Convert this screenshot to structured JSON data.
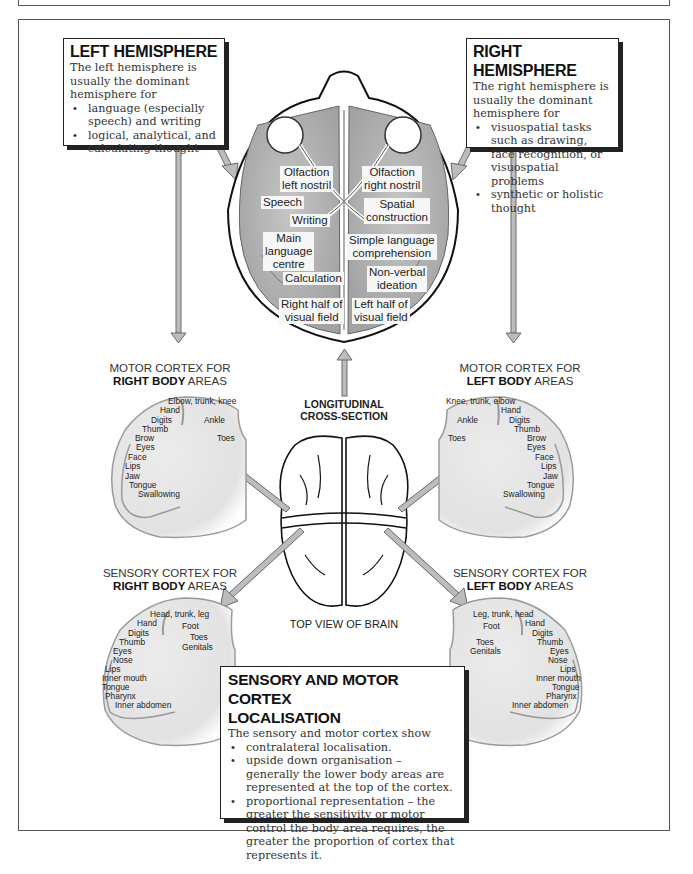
{
  "left_hemisphere": {
    "title": "LEFT HEMISPHERE",
    "intro": "The left hemisphere is usually the dominant hemisphere for",
    "bullets": [
      "language (especially speech) and writing",
      "logical, analytical, and calculating thought"
    ]
  },
  "right_hemisphere": {
    "title": "RIGHT HEMISPHERE",
    "intro": "The right hemisphere is usually the dominant hemisphere for",
    "bullets": [
      "visuospatial tasks such as drawing, face recognition, or visuospatial problems",
      "synthetic or holistic thought"
    ]
  },
  "cross_section": {
    "caption_line1": "LONGITUDINAL",
    "caption_line2": "CROSS-SECTION",
    "labels": {
      "olfaction_left": [
        "Olfaction",
        "left nostril"
      ],
      "olfaction_right": [
        "Olfaction",
        "right nostril"
      ],
      "speech": "Speech",
      "writing": "Writing",
      "spatial": [
        "Spatial",
        "construction"
      ],
      "main_language": [
        "Main",
        "language",
        "centre"
      ],
      "simple_language": [
        "Simple language",
        "comprehension"
      ],
      "calculation": "Calculation",
      "non_verbal": [
        "Non-verbal",
        "ideation"
      ],
      "right_visual": [
        "Right half of",
        "visual field"
      ],
      "left_visual": [
        "Left half of",
        "visual field"
      ]
    }
  },
  "top_view": {
    "caption": "TOP VIEW OF BRAIN"
  },
  "motor_right": {
    "title_pre": "MOTOR CORTEX FOR",
    "title_bold": "RIGHT BODY",
    "title_post": " AREAS",
    "areas": [
      "Elbow, trunk, knee",
      "Hand",
      "Digits",
      "Ankle",
      "Thumb",
      "Toes",
      "Brow",
      "Eyes",
      "Face",
      "Lips",
      "Jaw",
      "Tongue",
      "Swallowing"
    ]
  },
  "motor_left": {
    "title_pre": "MOTOR CORTEX FOR",
    "title_bold": "LEFT BODY",
    "title_post": " AREAS",
    "areas": [
      "Knee, trunk, elbow",
      "Hand",
      "Ankle",
      "Digits",
      "Thumb",
      "Toes",
      "Brow",
      "Eyes",
      "Face",
      "Lips",
      "Jaw",
      "Tongue",
      "Swallowing"
    ]
  },
  "sensory_right": {
    "title_pre": "SENSORY CORTEX FOR",
    "title_bold": "RIGHT BODY",
    "title_post": " AREAS",
    "areas": [
      "Head, trunk, leg",
      "Hand",
      "Foot",
      "Digits",
      "Toes",
      "Thumb",
      "Genitals",
      "Eyes",
      "Nose",
      "Lips",
      "Inner mouth",
      "Tongue",
      "Pharynx",
      "Inner abdomen"
    ]
  },
  "sensory_left": {
    "title_pre": "SENSORY CORTEX FOR",
    "title_bold": "LEFT BODY",
    "title_post": " AREAS",
    "areas": [
      "Leg, trunk, head",
      "Foot",
      "Hand",
      "Digits",
      "Toes",
      "Thumb",
      "Genitals",
      "Eyes",
      "Nose",
      "Lips",
      "Inner mouth",
      "Tongue",
      "Pharynx",
      "Inner abdomen"
    ]
  },
  "localisation": {
    "title_line1": "SENSORY AND MOTOR CORTEX",
    "title_line2": "LOCALISATION",
    "intro": "The sensory and motor cortex show",
    "bullets": [
      "contralateral localisation.",
      "upside down organisation – generally the lower body areas are represented at the top of the cortex.",
      "proportional representation – the greater the sensitivity or motor control the body area requires, the greater the proportion of cortex that represents it."
    ]
  },
  "colors": {
    "border": "#222222",
    "arrow_fill": "#b8b8b8",
    "arrow_stroke": "#666666",
    "brain_fill": "#b4b4b4",
    "cortex_fill": "#e6e6e6"
  }
}
